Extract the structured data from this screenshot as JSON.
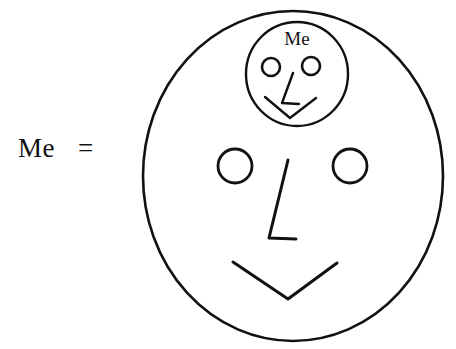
{
  "canvas": {
    "width": 456,
    "height": 349,
    "background_color": "#ffffff",
    "ink_color": "#111111"
  },
  "equation": {
    "subject_label": "Me",
    "equals_sign": "=",
    "subject_x": 18,
    "subject_y": 157,
    "equals_x": 78,
    "equals_y": 157
  },
  "outer_face": {
    "name": "outer-face",
    "center_x": 293,
    "center_y": 176,
    "radius_x": 150,
    "radius_y": 165,
    "left_eye": {
      "center_x": 235,
      "center_y": 166,
      "radius": 17
    },
    "right_eye": {
      "center_x": 350,
      "center_y": 166,
      "radius": 17
    },
    "nose_path": "M 288 160 L 269 238 L 296 239",
    "mouth_path": "M 233 262 L 288 299 L 337 263"
  },
  "inner_face": {
    "name": "inner-face",
    "label": "Me",
    "label_x": 297,
    "label_y": 45,
    "center_x": 297,
    "center_y": 74,
    "radius_x": 51,
    "radius_y": 52,
    "left_eye": {
      "center_x": 271,
      "center_y": 67,
      "radius": 9
    },
    "right_eye": {
      "center_x": 311,
      "center_y": 66,
      "radius": 9
    },
    "nose_path": "M 293 73 L 282 103 L 299 104",
    "mouth_path": "M 265 97 L 290 118 L 316 98"
  }
}
